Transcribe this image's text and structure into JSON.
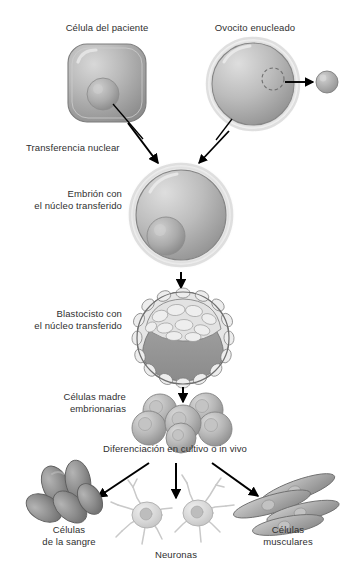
{
  "figure": {
    "title_alt": "Transferencia nuclear de células somáticas",
    "background_color": "#ffffff",
    "text_color": "#2f2f2f",
    "line_color": "#000000"
  },
  "labels": {
    "patient_cell": "Célula del paciente",
    "enucleated_oocyte": "Ovocito enucleado",
    "nuclear_transfer": "Transferencia nuclear",
    "embryo": "Embrión con\nel núcleo transferido",
    "blastocyst": "Blastocisto con\nel núcleo transferido",
    "stem_cells": "Células madre\nembrionarias",
    "differentiation": "Diferenciación en cultivo o in vivo",
    "blood_cells": "Células\nde la sangre",
    "neurons": "Neuronas",
    "muscle_cells": "Células\nmusculares"
  },
  "structures": [
    {
      "name": "patient-cell",
      "shape": "rounded-square",
      "has_nucleus": true
    },
    {
      "name": "enucleated-oocyte",
      "shape": "circle",
      "has_nucleus": false,
      "removed_nucleus_marker": "dashed-circle"
    },
    {
      "name": "extracted-nucleus",
      "shape": "small-circle"
    },
    {
      "name": "reconstructed-embryo",
      "shape": "circle",
      "has_nucleus": true
    },
    {
      "name": "blastocyst",
      "shape": "circle",
      "features": [
        "trophoblast-ring",
        "inner-cell-mass",
        "blastocoel-cavity"
      ]
    },
    {
      "name": "stem-cell-cluster",
      "cell_count": 6
    },
    {
      "name": "blood-cell-cluster",
      "cell_count": 5
    },
    {
      "name": "neuron-pair",
      "cell_count": 2
    },
    {
      "name": "muscle-cell-group",
      "cell_count": 4
    }
  ],
  "arrows": [
    {
      "name": "oocyte-nucleus-removal",
      "from": "enucleated-oocyte",
      "to": "extracted-nucleus"
    },
    {
      "name": "patient-cell-to-embryo",
      "from": "patient-cell",
      "to": "reconstructed-embryo"
    },
    {
      "name": "oocyte-to-embryo",
      "from": "enucleated-oocyte",
      "to": "reconstructed-embryo"
    },
    {
      "name": "embryo-to-blastocyst",
      "from": "reconstructed-embryo",
      "to": "blastocyst"
    },
    {
      "name": "blastocyst-to-stem-cells",
      "from": "blastocyst",
      "to": "stem-cell-cluster"
    },
    {
      "name": "stem-cells-to-blood",
      "from": "stem-cell-cluster",
      "to": "blood-cell-cluster"
    },
    {
      "name": "stem-cells-to-neurons",
      "from": "stem-cell-cluster",
      "to": "neuron-pair"
    },
    {
      "name": "stem-cells-to-muscle",
      "from": "stem-cell-cluster",
      "to": "muscle-cell-group"
    }
  ]
}
